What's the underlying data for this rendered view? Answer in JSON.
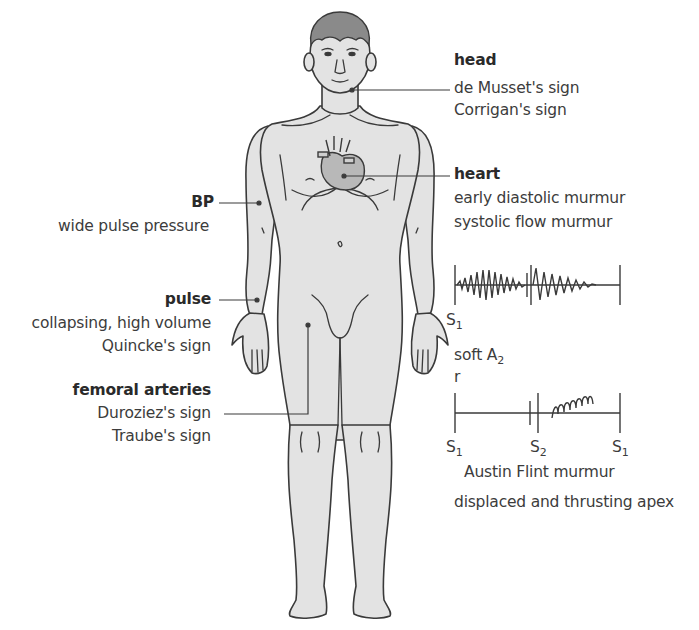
{
  "diagram": {
    "colors": {
      "body_fill": "#e3e3e3",
      "outline": "#3a3a3a",
      "hair": "#8a8a8a",
      "heart_fill": "#b8b8b8",
      "text": "#3c3c3c"
    },
    "labels": {
      "head": {
        "title": "head",
        "items": [
          "de Musset's sign",
          "Corrigan's sign"
        ]
      },
      "heart": {
        "title": "heart",
        "items": [
          "early diastolic murmur",
          "systolic flow murmur"
        ]
      },
      "bp": {
        "title": "BP",
        "items": [
          "wide pulse pressure"
        ]
      },
      "pulse": {
        "title": "pulse",
        "items": [
          "collapsing, high volume",
          "Quincke's sign"
        ]
      },
      "femoral": {
        "title": "femoral arteries",
        "items": [
          "Duroziez's sign",
          "Traube's sign"
        ]
      }
    },
    "phonocardiogram_1": {
      "marker_left": "S",
      "marker_left_sub": "1",
      "caption": "soft A",
      "caption_sub": "2",
      "caption_extra": "r"
    },
    "phonocardiogram_2": {
      "markers": [
        {
          "label": "S",
          "sub": "1"
        },
        {
          "label": "S",
          "sub": "2"
        },
        {
          "label": "S",
          "sub": "1"
        }
      ],
      "caption": "Austin Flint murmur"
    },
    "apex_note": "displaced and thrusting apex"
  }
}
